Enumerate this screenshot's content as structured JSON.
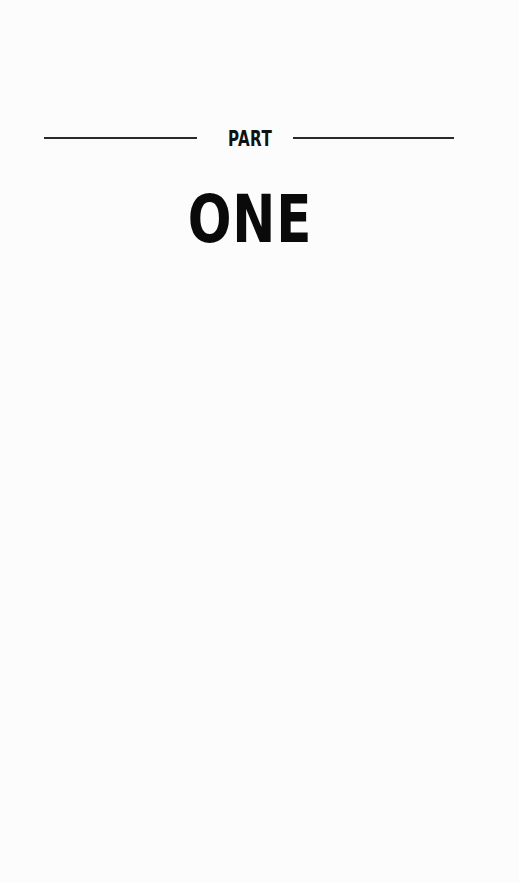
{
  "part_title": {
    "label": "PART",
    "number": "ONE"
  },
  "colors": {
    "background": "#fcfcfc",
    "text": "#0a0a0a",
    "rule": "#2a2a2a"
  }
}
